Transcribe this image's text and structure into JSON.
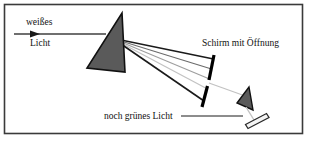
{
  "figure": {
    "name": "prism-dispersion-diagram",
    "background_color": "#ffffff",
    "border_color": "#3a3a3a",
    "frame": {
      "x": 4,
      "y": 4,
      "width": 299,
      "height": 130
    }
  },
  "labels": {
    "incoming_light_line1": "weißes",
    "incoming_light_line2": "Licht",
    "screen_with_aperture": "Schirm mit Öffnung",
    "still_green_light": "noch grünes Licht"
  },
  "colors": {
    "prism_fill": "#5a5a5a",
    "prism_stroke": "#111111",
    "screen": "#000000",
    "ray_dark": "#1a1a1a",
    "ray_mid": "#6b6b6b",
    "ray_light": "#9e9e9e",
    "ray_pale": "#c2c2c2",
    "text": "#111111",
    "arrow": "#3f3f3f",
    "detector_fill": "#f2f2f2",
    "detector_stroke": "#2a2a2a"
  },
  "elements": {
    "incoming_beam": {
      "x1": 14,
      "y1": 34,
      "x2": 104,
      "y2": 34
    },
    "main_prism": {
      "apex": [
        122,
        13
      ],
      "base_left": [
        87,
        68
      ],
      "base_right": [
        125,
        72
      ]
    },
    "screen_upper": {
      "x1": 214,
      "y1": 56,
      "x2": 209,
      "y2": 80
    },
    "screen_lower": {
      "x1": 207,
      "y1": 86,
      "x2": 202,
      "y2": 106
    },
    "small_prism": {
      "apex": [
        249,
        88
      ],
      "base_left": [
        238,
        104
      ],
      "base_right": [
        253,
        109
      ]
    },
    "detector": {
      "x1": 246,
      "y1": 122,
      "x2": 268,
      "y2": 112,
      "thickness": 4
    },
    "leader_line": {
      "x1": 180,
      "y1": 116,
      "x2": 243,
      "y2": 116
    }
  },
  "rays": [
    {
      "name": "ray-1",
      "x1": 121,
      "y1": 40,
      "x2": 213,
      "y2": 60,
      "shade": "ray_dark",
      "width": 1.5
    },
    {
      "name": "ray-2",
      "x1": 121,
      "y1": 41,
      "x2": 211,
      "y2": 70,
      "shade": "ray_mid",
      "width": 1.1
    },
    {
      "name": "ray-3",
      "x1": 121,
      "y1": 42,
      "x2": 209,
      "y2": 80,
      "shade": "ray_light",
      "width": 1.1
    },
    {
      "name": "ray-4",
      "x1": 121,
      "y1": 43,
      "x2": 207,
      "y2": 89,
      "shade": "ray_pale",
      "width": 1.1
    },
    {
      "name": "ray-5",
      "x1": 121,
      "y1": 44,
      "x2": 204,
      "y2": 100,
      "shade": "ray_dark",
      "width": 1.5
    }
  ],
  "transmitted_rays": [
    {
      "name": "aperture-ray",
      "x1": 209,
      "y1": 83,
      "x2": 247,
      "y2": 96,
      "shade": "ray_pale"
    },
    {
      "name": "exit-ray",
      "x1": 246,
      "y1": 106,
      "x2": 254,
      "y2": 119,
      "shade": "ray_pale"
    }
  ]
}
